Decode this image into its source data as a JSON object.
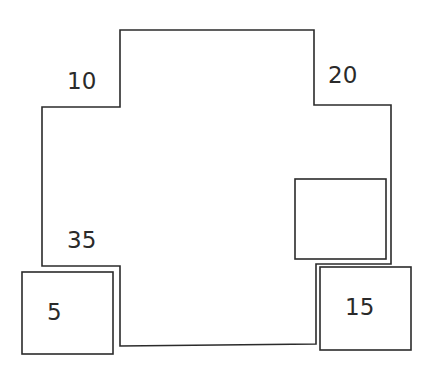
{
  "diagram": {
    "type": "floor-plan-blocks",
    "stroke_color": "#2b2b2b",
    "background": "#ffffff",
    "labels": {
      "top_left_step": "10",
      "top_right_step": "20",
      "bottom_left_step": "35",
      "bottom_left_box": "5",
      "bottom_right_box": "15"
    },
    "shapes": [
      {
        "name": "main-polygon",
        "points": "120,30 314,30 314,105 391,105 391,264 316,264 316,344 120,346 120,266 42,266 42,107 120,107"
      },
      {
        "name": "inner-box",
        "x": 295,
        "y": 179,
        "w": 91,
        "h": 80
      },
      {
        "name": "box-5",
        "x": 22,
        "y": 272,
        "w": 91,
        "h": 82
      },
      {
        "name": "box-15",
        "x": 320,
        "y": 267,
        "w": 91,
        "h": 83
      }
    ]
  }
}
